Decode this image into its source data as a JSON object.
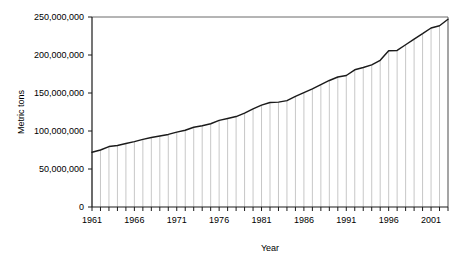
{
  "chart_data": {
    "type": "line",
    "title": "",
    "xlabel": "Year",
    "ylabel": "Metric tons",
    "grid": false,
    "legend": null,
    "xlim": [
      1961,
      2003
    ],
    "ylim": [
      0,
      250000000
    ],
    "ytick_labels": [
      "0",
      "50,000,000",
      "100,000,000",
      "150,000,000",
      "200,000,000",
      "250,000,000"
    ],
    "ytick_values": [
      0,
      50000000,
      100000000,
      150000000,
      200000000,
      250000000
    ],
    "xtick_labels": [
      "1961",
      "1966",
      "1971",
      "1976",
      "1981",
      "1986",
      "1991",
      "1996",
      "2001"
    ],
    "xtick_values": [
      1961,
      1966,
      1971,
      1976,
      1981,
      1986,
      1991,
      1996,
      2001
    ],
    "x": [
      1961,
      1962,
      1963,
      1964,
      1965,
      1966,
      1967,
      1968,
      1969,
      1970,
      1971,
      1972,
      1973,
      1974,
      1975,
      1976,
      1977,
      1978,
      1979,
      1980,
      1981,
      1982,
      1983,
      1984,
      1985,
      1986,
      1987,
      1988,
      1989,
      1990,
      1991,
      1992,
      1993,
      1994,
      1995,
      1996,
      1997,
      1998,
      1999,
      2000,
      2001,
      2002,
      2003
    ],
    "values": [
      72000000,
      75000000,
      79500000,
      81000000,
      83500000,
      86000000,
      89000000,
      91500000,
      93500000,
      95500000,
      98500000,
      101000000,
      105000000,
      107000000,
      109500000,
      114000000,
      116500000,
      119000000,
      123500000,
      129000000,
      134000000,
      137500000,
      138000000,
      140000000,
      145500000,
      150500000,
      155500000,
      161000000,
      166500000,
      171000000,
      173000000,
      180500000,
      183500000,
      187000000,
      193000000,
      205500000,
      206000000,
      213500000,
      221000000,
      228000000,
      235500000,
      238500000,
      247000000
    ],
    "series_name": "Production",
    "dropline_color": "#b9b9b9",
    "line_color": "#1b1b1b",
    "background_color": "#ffffff",
    "axis_color": "#1a1a1a"
  },
  "axis_titles": {
    "y": "Metric tons",
    "x": "Year"
  }
}
